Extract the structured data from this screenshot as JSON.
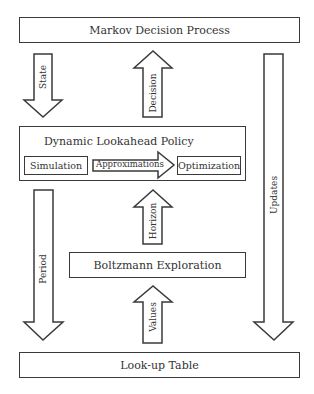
{
  "diagram": {
    "nodes": {
      "mdp": "Markov Decision Process",
      "policy": "Dynamic Lookahead Policy",
      "simulation": "Simulation",
      "optimization": "Optimization",
      "boltzmann": "Boltzmann Exploration",
      "lookup": "Look-up Table"
    },
    "edges": {
      "state": "State",
      "decision": "Decision",
      "approximations": "Approximations",
      "period": "Period",
      "horizon": "Horizon",
      "values": "Values",
      "updates": "Updates"
    },
    "colors": {
      "stroke": "#3a3a3a",
      "fill": "#ffffff",
      "text": "#333333"
    }
  }
}
